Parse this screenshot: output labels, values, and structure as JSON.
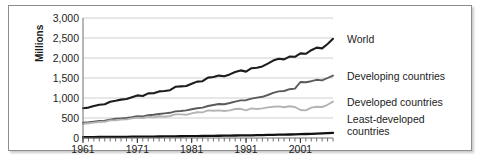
{
  "chart_data": {
    "type": "line",
    "title": "",
    "xlabel": "",
    "ylabel": "Yield (kg /ha)",
    "y_unit_label": "Millions",
    "xlim": [
      1961,
      2007
    ],
    "ylim": [
      0,
      3000
    ],
    "grid": true,
    "legend_position": "right",
    "y_ticks": [
      "0",
      "500",
      "1,000",
      "1,500",
      "2,000",
      "2,500",
      "3,000"
    ],
    "y_tick_values": [
      0,
      500,
      1000,
      1500,
      2000,
      2500,
      3000
    ],
    "x_ticks": [
      "1961",
      "1971",
      "1981",
      "1991",
      "2001"
    ],
    "x_tick_values": [
      1961,
      1971,
      1981,
      1991,
      2001
    ],
    "x_minor_tick_interval": 1,
    "x": [
      1961,
      1962,
      1963,
      1964,
      1965,
      1966,
      1967,
      1968,
      1969,
      1970,
      1971,
      1972,
      1973,
      1974,
      1975,
      1976,
      1977,
      1978,
      1979,
      1980,
      1981,
      1982,
      1983,
      1984,
      1985,
      1986,
      1987,
      1988,
      1989,
      1990,
      1991,
      1992,
      1993,
      1994,
      1995,
      1996,
      1997,
      1998,
      1999,
      2000,
      2001,
      2002,
      2003,
      2004,
      2005,
      2006,
      2007
    ],
    "series": [
      {
        "name": "World",
        "color": "#1c1c1c",
        "width": 2.1,
        "values": [
          745,
          760,
          800,
          830,
          845,
          905,
          930,
          960,
          975,
          1020,
          1065,
          1050,
          1115,
          1120,
          1165,
          1175,
          1195,
          1280,
          1290,
          1300,
          1355,
          1410,
          1420,
          1510,
          1525,
          1560,
          1545,
          1590,
          1650,
          1690,
          1660,
          1745,
          1755,
          1790,
          1860,
          1935,
          1980,
          1965,
          2035,
          2030,
          2115,
          2105,
          2195,
          2260,
          2240,
          2350,
          2480
        ]
      },
      {
        "name": "Developing countries",
        "color": "#5a5a5a",
        "width": 1.9,
        "values": [
          385,
          395,
          410,
          425,
          430,
          455,
          480,
          490,
          500,
          520,
          545,
          540,
          570,
          580,
          600,
          615,
          630,
          665,
          675,
          690,
          720,
          745,
          760,
          800,
          825,
          850,
          845,
          875,
          910,
          940,
          945,
          985,
          1010,
          1030,
          1075,
          1130,
          1165,
          1175,
          1220,
          1235,
          1400,
          1395,
          1420,
          1455,
          1440,
          1500,
          1560
        ]
      },
      {
        "name": "Developed countries",
        "color": "#b4b4b4",
        "width": 1.9,
        "values": [
          355,
          370,
          385,
          400,
          405,
          440,
          445,
          460,
          465,
          490,
          510,
          500,
          530,
          515,
          545,
          530,
          550,
          590,
          590,
          580,
          615,
          645,
          640,
          690,
          680,
          690,
          675,
          690,
          725,
          730,
          690,
          740,
          725,
          740,
          765,
          780,
          790,
          770,
          795,
          775,
          700,
          690,
          760,
          780,
          775,
          830,
          910
        ]
      },
      {
        "name": "Least-developed countries",
        "color": "#111111",
        "width": 2.3,
        "values": [
          22,
          23,
          24,
          25,
          26,
          27,
          28,
          29,
          30,
          32,
          33,
          34,
          35,
          36,
          38,
          39,
          41,
          42,
          44,
          45,
          47,
          49,
          50,
          52,
          54,
          56,
          58,
          60,
          62,
          64,
          66,
          68,
          71,
          73,
          76,
          79,
          82,
          85,
          88,
          92,
          96,
          100,
          105,
          110,
          116,
          122,
          130
        ]
      }
    ],
    "legend_entries": [
      {
        "label": "World"
      },
      {
        "label": "Developing countries"
      },
      {
        "label": "Developed countries"
      },
      {
        "label": "Least-developed\ncountries"
      }
    ]
  }
}
